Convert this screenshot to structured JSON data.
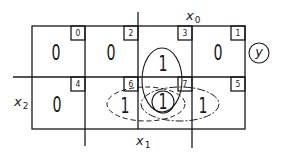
{
  "diagram": {
    "type": "karnaugh-map",
    "output": "y",
    "variables": {
      "x0": {
        "label": "x",
        "sub": "0"
      },
      "x1": {
        "label": "x",
        "sub": "1"
      },
      "x2": {
        "label": "x",
        "sub": "2"
      }
    },
    "cells": [
      {
        "index": "0",
        "value": "0"
      },
      {
        "index": "2",
        "value": "0"
      },
      {
        "index": "3",
        "value": "1"
      },
      {
        "index": "1",
        "value": "0"
      },
      {
        "index": "4",
        "value": "0"
      },
      {
        "index": "6",
        "value": "1"
      },
      {
        "index": "7",
        "value": "1"
      },
      {
        "index": "5",
        "value": "1"
      }
    ],
    "groupings": [
      {
        "name": "solid-group-3-7",
        "style": "solid"
      },
      {
        "name": "dashed-group-6-7",
        "style": "dashed"
      },
      {
        "name": "dashdot-group-7-5",
        "style": "dash-dot"
      },
      {
        "name": "circle-cell-7",
        "style": "solid"
      }
    ],
    "line_color": "#1a1a1a"
  }
}
